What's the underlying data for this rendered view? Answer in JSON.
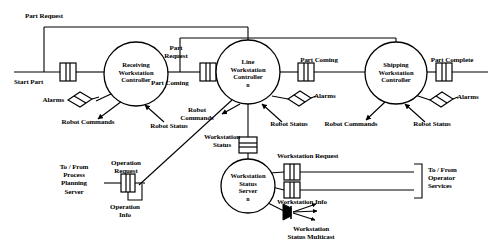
{
  "diagram": {
    "type": "block-diagram",
    "colors": {
      "line": "#000000",
      "background": "#ffffff",
      "text": "#000000"
    },
    "nodes": [
      {
        "id": "receiving",
        "label": "Receiving\nWorkstation\nController",
        "multiplicity": "",
        "cx": 136,
        "cy": 74,
        "r": 32
      },
      {
        "id": "line",
        "label": "Line\nWorkstation\nController",
        "multiplicity": "n",
        "cx": 248,
        "cy": 72,
        "r": 32
      },
      {
        "id": "shipping",
        "label": "Shipping\nWorkstation\nController",
        "multiplicity": "",
        "cx": 396,
        "cy": 73,
        "r": 31
      },
      {
        "id": "wss",
        "label": "Workstation\nStatus\nServer",
        "multiplicity": "n",
        "cx": 248,
        "cy": 186,
        "r": 27
      }
    ],
    "ports": [
      {
        "id": "start-part-port",
        "x": 68,
        "y": 72
      },
      {
        "id": "part-request-port",
        "x": 208,
        "y": 72
      },
      {
        "id": "part-coming-port",
        "x": 306,
        "y": 72
      },
      {
        "id": "part-complete-port",
        "x": 444,
        "y": 72
      },
      {
        "id": "workstation-status-port",
        "x": 248,
        "y": 145
      },
      {
        "id": "workstation-request-port",
        "x": 292,
        "y": 172
      },
      {
        "id": "workstation-info-port",
        "x": 292,
        "y": 190
      },
      {
        "id": "operation-request-port",
        "x": 128,
        "y": 183
      }
    ],
    "alarm_symbols": [
      {
        "id": "alarms-receiving",
        "x": 79,
        "y": 99
      },
      {
        "id": "alarms-line",
        "x": 298,
        "y": 94
      },
      {
        "id": "alarms-shipping",
        "x": 441,
        "y": 95
      }
    ],
    "multicast_symbol": {
      "id": "workstation-status-multicast",
      "x": 292,
      "y": 212
    },
    "labels": {
      "part_request_top": "Part Request",
      "start_part": "Start Part",
      "part_request_mid": "Part\nRequest",
      "part_coming_left": "Part Coming",
      "part_coming_right": "Part Coming",
      "part_complete": "Part Complete",
      "alarms_receiving": "Alarms",
      "alarms_line": "Alarms",
      "alarms_shipping": "Alarms",
      "robot_commands_receiving": "Robot Commands",
      "robot_status_receiving": "Robot Status",
      "robot_commands_line": "Robot\nCommands",
      "robot_status_line": "Robot Status",
      "robot_commands_shipping": "Robot Commands",
      "robot_status_shipping": "Robot Status",
      "workstation_status": "Workstation\nStatus",
      "workstation_request": "Workstation Request",
      "workstation_info": "Workstation Info",
      "workstation_status_multicast": "Workstation\nStatus Multicast",
      "operation_request": "Operation\nRequest",
      "operation_info": "Operation\nInfo",
      "to_from_process_planning_server": "To / From\nProcess\nPlanning\nServer",
      "to_from_operator_services": "To / From\nOperator\nServices"
    }
  }
}
